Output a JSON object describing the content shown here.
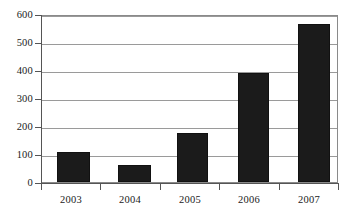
{
  "chart_data": {
    "type": "bar",
    "title": "",
    "subtitle": "",
    "xlabel": "",
    "ylabel": "",
    "categories": [
      "2003",
      "2004",
      "2005",
      "2006",
      "2007"
    ],
    "values": [
      110,
      60,
      178,
      393,
      571
    ],
    "series": [
      {
        "name": "",
        "values": [
          110,
          60,
          178,
          393,
          571
        ]
      }
    ],
    "ylim": [
      0,
      600
    ],
    "ytick_labels": [
      "0",
      "100",
      "200",
      "300",
      "400",
      "500",
      "600"
    ],
    "ytick_values": [
      0,
      100,
      200,
      300,
      400,
      500,
      600
    ],
    "grid": true,
    "grid_axis": "y",
    "legend": false,
    "legend_position": "none",
    "annotations": [],
    "colors": {
      "bar_fill": "#1b1b1b",
      "bar_edge": "#111111",
      "gridline": "#9a9a9a",
      "axis": "#555555",
      "plot_border": "#8a8a8a",
      "background": "#ffffff",
      "text": "#1a1a1a"
    }
  }
}
